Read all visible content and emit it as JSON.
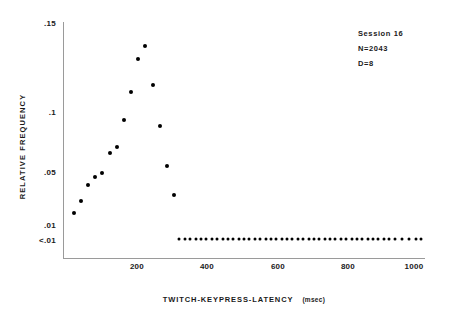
{
  "chart_data": {
    "type": "scatter",
    "title": "",
    "xlabel": "TWITCH-KEYPRESS-LATENCY",
    "xunits": "(msec)",
    "ylabel": "RELATIVE FREQUENCY",
    "xlim": [
      0,
      1010
    ],
    "ylim": [
      0,
      0.15
    ],
    "grid": false,
    "legend": "none",
    "xticks": [
      200,
      400,
      600,
      800,
      1000
    ],
    "xtick_labels": [
      "200",
      "400",
      "600",
      "800",
      "1000"
    ],
    "yticks": [
      0.15,
      0.1,
      0.05,
      0.01,
      0.0
    ],
    "ytick_labels": [
      ".15",
      ".1",
      ".05",
      ".01",
      "<.01"
    ],
    "annotations": [
      "Session 16",
      "N=2043",
      "D=8"
    ],
    "series": [
      {
        "name": "latency distribution",
        "x": [
          30,
          50,
          70,
          90,
          110,
          130,
          150,
          170,
          190,
          210,
          230,
          250,
          270,
          290,
          310
        ],
        "y": [
          0.019,
          0.028,
          0.04,
          0.046,
          0.049,
          0.066,
          0.071,
          0.093,
          0.111,
          0.13,
          0.137,
          0.115,
          0.088,
          0.055,
          0.033
        ]
      },
      {
        "name": "below-threshold floor",
        "floor_label": "<.01",
        "y_value": 0.004,
        "x": [
          325,
          340,
          355,
          370,
          385,
          400,
          415,
          430,
          445,
          460,
          475,
          490,
          505,
          520,
          535,
          550,
          565,
          580,
          595,
          610,
          625,
          640,
          655,
          670,
          685,
          700,
          715,
          730,
          745,
          760,
          775,
          790,
          805,
          820,
          835,
          850,
          865,
          880,
          895,
          910,
          925,
          945,
          965,
          985,
          1000
        ]
      }
    ]
  },
  "axes": {
    "y_tick_positions_px": [
      23,
      112,
      172,
      225,
      249
    ],
    "x_origin_px": 63,
    "x_end_px": 425,
    "y_top_px": 22,
    "y_bottom_px": 258
  }
}
